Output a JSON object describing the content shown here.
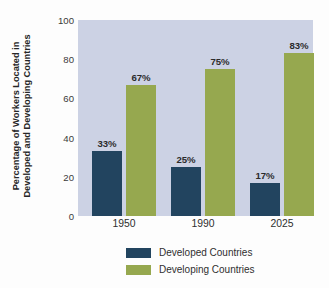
{
  "chart_data": {
    "type": "bar",
    "title": "",
    "subtitle": "",
    "xlabel": "",
    "ylabel_lines": [
      "Percentage of Workers Located in",
      "Developed and Developing Countries"
    ],
    "ylabel": "Percentage of Workers Located in Developed and Developing Countries",
    "categories": [
      "1950",
      "1990",
      "2025"
    ],
    "series": [
      {
        "name": "Developed Countries",
        "color": "#22445f",
        "values": [
          33,
          25,
          17
        ],
        "labels": [
          "33%",
          "25%",
          "17%"
        ]
      },
      {
        "name": "Developing Countries",
        "color": "#96a84f",
        "values": [
          67,
          75,
          83
        ],
        "labels": [
          "67%",
          "75%",
          "83%"
        ]
      }
    ],
    "ylim": [
      0,
      100
    ],
    "yticks": [
      0,
      20,
      40,
      60,
      80,
      100
    ],
    "ytick_labels": [
      "0",
      "20",
      "40",
      "60",
      "80",
      "100"
    ],
    "grid": false,
    "legend_position": "bottom",
    "plot_background": "#ccd2e4",
    "figure_background": "#fdfdfd"
  },
  "legend": {
    "items": [
      {
        "label": "Developed Countries",
        "color": "#22445f"
      },
      {
        "label": "Developing Countries",
        "color": "#96a84f"
      }
    ]
  }
}
